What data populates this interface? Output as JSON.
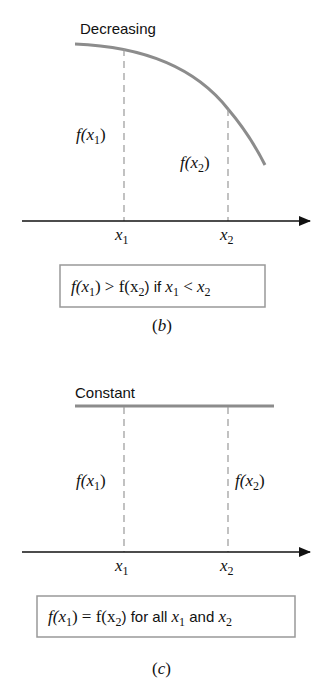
{
  "panels": [
    {
      "id": "b",
      "title": "Decreasing",
      "f_x1_label": "f(x",
      "f_x2_label": "f(x",
      "x1_label": "x",
      "x2_label": "x",
      "sub1": "1",
      "sub2": "2",
      "condition": {
        "part1": "f(x",
        "part2": ") > f(x",
        "part3": ") if ",
        "part4": " < ",
        "text": "f(x1) > f(x2) if x1 < x2"
      },
      "caption": "(b)"
    },
    {
      "id": "c",
      "title": "Constant",
      "f_x1_label": "f(x",
      "f_x2_label": "f(x",
      "x1_label": "x",
      "x2_label": "x",
      "sub1": "1",
      "sub2": "2",
      "condition": {
        "part1": "f(x",
        "part2": ") = f(x",
        "part3": ") for all ",
        "part4": " and ",
        "text": "f(x1) = f(x2) for all x1 and x2"
      },
      "caption": "(c)"
    }
  ],
  "colors": {
    "curve": "#8c8c8c",
    "dash": "#999999",
    "axis": "#111111",
    "box": "#999999"
  }
}
